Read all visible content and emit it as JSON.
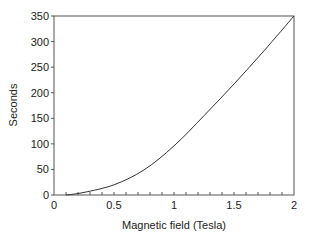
{
  "chart_data": {
    "type": "line",
    "title": "",
    "xlabel": "Magnetic field (Tesla)",
    "ylabel": "Seconds",
    "xlim": [
      0,
      2
    ],
    "ylim": [
      0,
      350
    ],
    "x_ticks": [
      "0",
      "0.5",
      "1",
      "1.5",
      "2"
    ],
    "y_ticks": [
      "0",
      "50",
      "100",
      "150",
      "200",
      "250",
      "300",
      "350"
    ],
    "grid": false,
    "legend": null,
    "series": [
      {
        "name": "Seconds vs Magnetic field",
        "x": [
          0.1,
          0.25,
          0.5,
          0.75,
          1.0,
          1.25,
          1.5,
          1.75,
          2.0
        ],
        "y": [
          0,
          5,
          20,
          49,
          96,
          155,
          217,
          282,
          350
        ]
      }
    ]
  },
  "colors": {
    "line": "#333333",
    "axis": "#555555"
  }
}
